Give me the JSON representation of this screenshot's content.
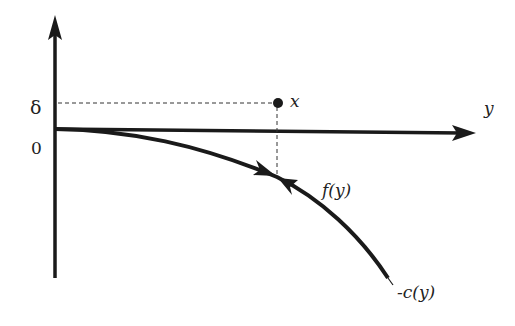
{
  "diagram": {
    "axes": {
      "vertical_axis_label_delta": "δ",
      "vertical_axis_label_zero": "0",
      "horizontal_axis_label": "y"
    },
    "point": {
      "label": "x"
    },
    "curves": [
      {
        "label": "f(y)"
      },
      {
        "label": "-c(y)"
      }
    ],
    "colors": {
      "ink": "#1a1a1a",
      "background": "#ffffff"
    }
  }
}
